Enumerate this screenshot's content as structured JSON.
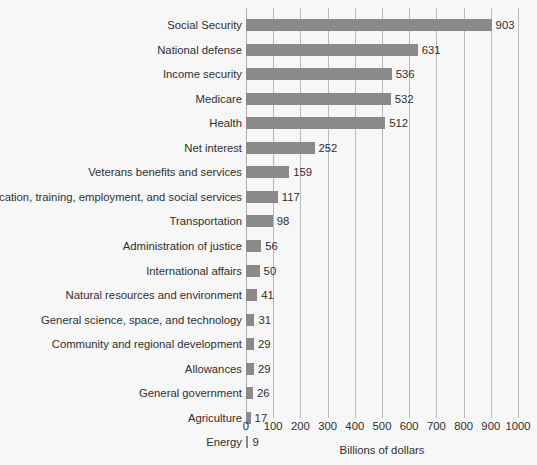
{
  "chart_data": {
    "type": "bar",
    "orientation": "horizontal",
    "title": "",
    "xlabel": "Billions of dollars",
    "ylabel": "",
    "xlim": [
      0,
      1000
    ],
    "xticks": [
      0,
      100,
      200,
      300,
      400,
      500,
      600,
      700,
      800,
      900,
      1000
    ],
    "xtick_labels": [
      "0",
      "100",
      "200",
      "300",
      "400",
      "500",
      "600",
      "700",
      "800",
      "900",
      "1000"
    ],
    "grid": true,
    "legend": false,
    "bar_color": "#8a8a8a",
    "background_color": "#f7f7f7",
    "text_color": "#2f2f2f",
    "gridline_color": "#b9b9b9",
    "show_value_labels": true,
    "categories": [
      "Social Security",
      "National defense",
      "Income security",
      "Medicare",
      "Health",
      "Net interest",
      "Veterans benefits and services",
      "Education, training, employment, and social services",
      "Transportation",
      "Administration of justice",
      "International affairs",
      "Natural resources and environment",
      "General science, space, and technology",
      "Community and regional development",
      "Allowances",
      "General government",
      "Agriculture",
      "Energy"
    ],
    "values": [
      903,
      631,
      536,
      532,
      512,
      252,
      159,
      117,
      98,
      56,
      50,
      41,
      31,
      29,
      29,
      26,
      17,
      9
    ],
    "value_labels": [
      "903",
      "631",
      "536",
      "532",
      "512",
      "252",
      "159",
      "117",
      "98",
      "56",
      "50",
      "41",
      "31",
      "29",
      "29",
      "26",
      "17",
      "9"
    ]
  }
}
